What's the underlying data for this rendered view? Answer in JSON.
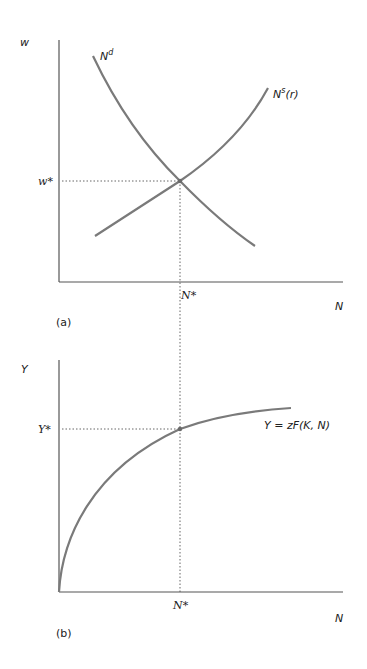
{
  "figure": {
    "panel_a": {
      "tag": "(a)",
      "y_axis_label": "w",
      "x_axis_label": "N",
      "equilibrium_wage_label": "w*",
      "equilibrium_employment_label": "N*",
      "demand_curve": {
        "base": "N",
        "superscript": "d"
      },
      "supply_curve": {
        "base": "N",
        "superscript": "s",
        "suffix": "(r)"
      }
    },
    "panel_b": {
      "tag": "(b)",
      "y_axis_label": "Y",
      "x_axis_label": "N",
      "equilibrium_output_label": "Y*",
      "equilibrium_employment_label": "N*",
      "production_function_label": "Y = zF(K, N)"
    },
    "colors": {
      "curve": "#7a7a7a",
      "axis": "#555555",
      "guide": "#666666"
    }
  }
}
